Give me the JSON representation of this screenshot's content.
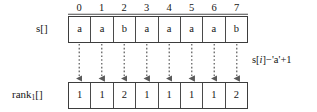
{
  "figure": {
    "index_header": [
      "0",
      "1",
      "2",
      "3",
      "4",
      "5",
      "6",
      "7"
    ],
    "rows": [
      {
        "name": "s",
        "label": "s[]",
        "label_base": "s",
        "label_sub": "",
        "label_suffix": "[]",
        "values": [
          "a",
          "a",
          "b",
          "a",
          "a",
          "a",
          "a",
          "b"
        ]
      },
      {
        "name": "rank1",
        "label": "rank₁[]",
        "label_base": "rank",
        "label_sub": "1",
        "label_suffix": "[]",
        "values": [
          "1",
          "1",
          "2",
          "1",
          "1",
          "1",
          "1",
          "2"
        ]
      }
    ],
    "annotation": {
      "full": "s[i]−'a'+1",
      "prefix": "s[",
      "italic_var": "i",
      "suffix": "]−'a'+1"
    },
    "arrow_count": 8,
    "colors": {
      "background": "#ffffff",
      "text": "#161616",
      "box_outer": "#3d3d3d",
      "box_inner": "#4a4a4a",
      "arrow": "#5a5a5a",
      "header_rule": "#4a4a4a"
    }
  }
}
